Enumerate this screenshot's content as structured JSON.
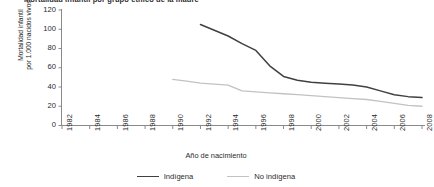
{
  "chart": {
    "title": "Mortalidad infantil por grupo étnico de la madre",
    "ylabel_line1": "Mortalidad infantil",
    "ylabel_line2": "por 1.000 nacidos vivos",
    "xlabel": "Año de nacimiento"
  },
  "legend": {
    "items": [
      {
        "label": "Indígena",
        "color": "#404040"
      },
      {
        "label": "No indígena",
        "color": "#c2c2c2"
      }
    ]
  },
  "axis": {
    "y_ticks": [
      "120",
      "100",
      "80",
      "60",
      "40",
      "20",
      "0"
    ],
    "x_ticks": [
      "1982",
      "1984",
      "1986",
      "1988",
      "1990",
      "1992",
      "1994",
      "1996",
      "1998",
      "2000",
      "2002",
      "2004",
      "2006",
      "2008"
    ]
  },
  "chart_data": {
    "type": "line",
    "title": "Mortalidad infantil por grupo étnico de la madre",
    "xlabel": "Año de nacimiento",
    "ylabel": "Mortalidad infantil por 1.000 nacidos vivos",
    "xlim": [
      1982,
      2008
    ],
    "ylim": [
      0,
      120
    ],
    "yticks": [
      0,
      20,
      40,
      60,
      80,
      100,
      120
    ],
    "xticks": [
      1982,
      1984,
      1986,
      1988,
      1990,
      1992,
      1994,
      1996,
      1998,
      2000,
      2002,
      2004,
      2006,
      2008
    ],
    "grid": false,
    "legend_position": "bottom",
    "series": [
      {
        "name": "Indígena",
        "color": "#404040",
        "x": [
          1992,
          1993,
          1994,
          1995,
          1996,
          1997,
          1998,
          1999,
          2000,
          2001,
          2002,
          2003,
          2004,
          2005,
          2006,
          2007,
          2008
        ],
        "values": [
          105,
          99,
          93,
          85,
          78,
          62,
          51,
          47,
          45,
          44,
          43,
          42,
          40,
          36,
          32,
          30,
          29
        ]
      },
      {
        "name": "No indígena",
        "color": "#c2c2c2",
        "x": [
          1990,
          1991,
          1992,
          1993,
          1994,
          1995,
          1996,
          1997,
          1998,
          1999,
          2000,
          2001,
          2002,
          2003,
          2004,
          2005,
          2006,
          2007,
          2008
        ],
        "values": [
          48,
          46,
          44,
          43,
          42,
          36,
          35,
          34,
          33,
          32,
          31,
          30,
          29,
          28,
          27,
          25,
          23,
          21,
          20
        ]
      }
    ]
  }
}
